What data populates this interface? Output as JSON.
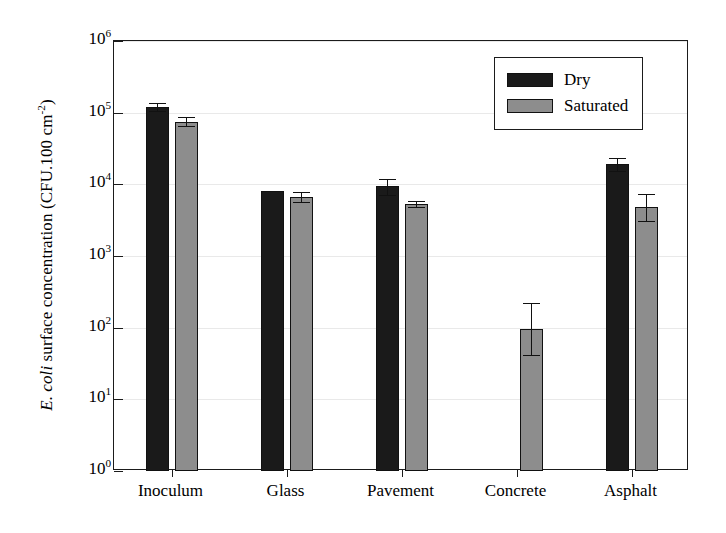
{
  "chart_data": {
    "type": "bar",
    "title": "",
    "xlabel": "",
    "ylabel": "E. coli surface concentration (CFU.100 cm-2)",
    "ylabel_parts": {
      "italic": "E. coli",
      "rest": " surface concentration (CFU.100 cm",
      "exponent": "-2",
      "close": ")"
    },
    "scale": "log",
    "ylim": [
      1,
      1000000
    ],
    "grid": true,
    "legend_position": "top-right",
    "categories": [
      "Inoculum",
      "Glass",
      "Pavement",
      "Concrete",
      "Asphalt"
    ],
    "ytick_labels": [
      "10⁰",
      "10¹",
      "10²",
      "10³",
      "10⁴",
      "10⁵",
      "10⁶"
    ],
    "ytick_bases": [
      "10",
      "10",
      "10",
      "10",
      "10",
      "10",
      "10"
    ],
    "ytick_exponents": [
      "0",
      "1",
      "2",
      "3",
      "4",
      "5",
      "6"
    ],
    "ytick_values": [
      1,
      10,
      100,
      1000,
      10000,
      100000,
      1000000
    ],
    "series": [
      {
        "name": "Dry",
        "color": "#1a1a1a",
        "values": [
          120000,
          8000,
          9500,
          null,
          19000
        ],
        "err_low": [
          105000,
          8000,
          7200,
          null,
          15500
        ],
        "err_high": [
          135000,
          8000,
          12000,
          null,
          23000
        ]
      },
      {
        "name": "Saturated",
        "color": "#8d8d8d",
        "values": [
          75000,
          6600,
          5300,
          95,
          4800
        ],
        "err_low": [
          66000,
          5700,
          4900,
          42,
          3100
        ],
        "err_high": [
          88000,
          7900,
          5800,
          220,
          7400
        ]
      }
    ]
  },
  "legend": {
    "entries": [
      {
        "label": "Dry",
        "swatch": "dry"
      },
      {
        "label": "Saturated",
        "swatch": "sat"
      }
    ]
  }
}
